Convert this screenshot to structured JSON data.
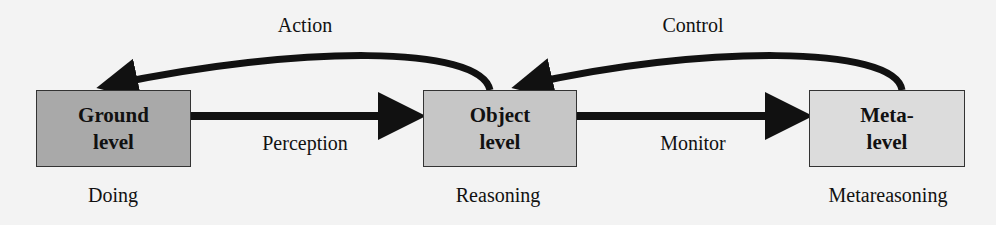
{
  "colors": {
    "ground": "#a9a9a9",
    "object": "#c6c6c6",
    "meta": "#dcdcdc",
    "arrow": "#111111",
    "background": "#f3f3f3"
  },
  "nodes": [
    {
      "id": "ground",
      "line1": "Ground",
      "line2": "level",
      "caption": "Doing"
    },
    {
      "id": "object",
      "line1": "Object",
      "line2": "level",
      "caption": "Reasoning"
    },
    {
      "id": "meta",
      "line1": "Meta-",
      "line2": "level",
      "caption": "Metareasoning"
    }
  ],
  "edges": [
    {
      "from": "ground",
      "to": "object",
      "label": "Perception"
    },
    {
      "from": "object",
      "to": "ground",
      "label": "Action"
    },
    {
      "from": "object",
      "to": "meta",
      "label": "Monitor"
    },
    {
      "from": "meta",
      "to": "object",
      "label": "Control"
    }
  ]
}
